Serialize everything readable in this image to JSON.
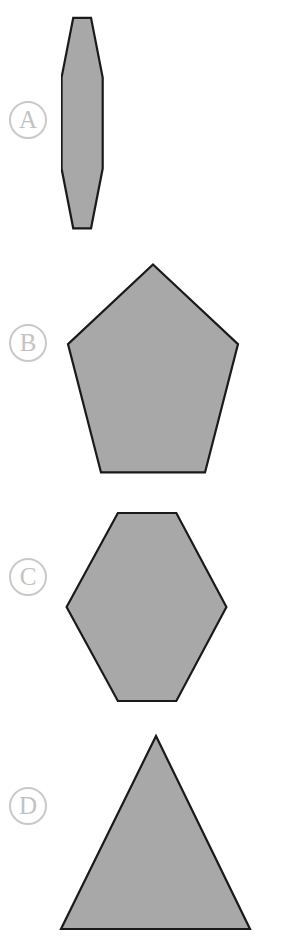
{
  "page": {
    "background_color": "#ffffff",
    "width": 301,
    "height": 939
  },
  "style": {
    "shape_fill": "#a8a8a8",
    "shape_stroke": "#1a1a1a",
    "label_color": "#c2c2c2",
    "label_border_color": "#c9c9c9"
  },
  "options": [
    {
      "label": "A",
      "shape_name": "octagon",
      "sides": 8,
      "label_position": {
        "x": 9,
        "y": 101
      },
      "bbox": {
        "x": 61,
        "y": 15,
        "width": 154,
        "height": 219
      },
      "points": "122,1 154,1 175,22 175,54 154,75 122,75 101,54 101,22"
    },
    {
      "label": "B",
      "shape_name": "pentagon",
      "sides": 5,
      "label_position": {
        "x": 9,
        "y": 324
      },
      "bbox": {
        "x": 65,
        "y": 262,
        "width": 176,
        "height": 213
      },
      "points": "88,1 173,63 140,163 36,163 3,63"
    },
    {
      "label": "C",
      "shape_name": "hexagon",
      "sides": 6,
      "label_position": {
        "x": 9,
        "y": 558
      },
      "bbox": {
        "x": 63,
        "y": 509,
        "width": 167,
        "height": 196
      },
      "points": "54,1 111,1 138,48 111,95 54,95 27,48"
    },
    {
      "label": "D",
      "shape_name": "triangle",
      "sides": 3,
      "label_position": {
        "x": 9,
        "y": 787
      },
      "bbox": {
        "x": 59,
        "y": 733,
        "width": 193,
        "height": 199
      },
      "points": "96,1 190,96 2,96"
    }
  ]
}
